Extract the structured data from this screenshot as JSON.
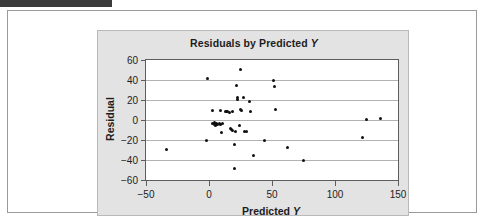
{
  "window": {
    "top_bar_color": "#3b3b3b",
    "page_background": "#ffffff",
    "panel_background": "#e3e3e3"
  },
  "chart_data": {
    "type": "scatter",
    "title": "Residuals by Predicted Y",
    "title_plain": "Residuals by Predicted ",
    "title_italic": "Y",
    "xlabel_plain": "Predicted ",
    "xlabel_italic": "Y",
    "xlabel": "Predicted Y",
    "ylabel": "Residual",
    "xlim": [
      -50,
      150
    ],
    "ylim": [
      -60,
      60
    ],
    "xticks": [
      -50,
      0,
      50,
      100,
      150
    ],
    "yticks": [
      60,
      40,
      20,
      0,
      -20,
      -40,
      -60
    ],
    "xtick_labels": [
      "−50",
      "0",
      "50",
      "100",
      "150"
    ],
    "ytick_labels": [
      "60",
      "40",
      "20",
      "0",
      "−20",
      "−40",
      "−60"
    ],
    "grid": "horizontal",
    "grid_color": "#b2b2b2",
    "legend": "none",
    "marker_color": "#101010",
    "marker_size_px": 3,
    "n_points": 48,
    "points": [
      [
        -34,
        -29
      ],
      [
        -1,
        42
      ],
      [
        -2,
        -20
      ],
      [
        3,
        10
      ],
      [
        3,
        -3
      ],
      [
        4,
        -4
      ],
      [
        4,
        -2
      ],
      [
        5,
        -5
      ],
      [
        5,
        -3
      ],
      [
        6,
        -3
      ],
      [
        7,
        -4
      ],
      [
        8,
        -3
      ],
      [
        9,
        10
      ],
      [
        9,
        -4
      ],
      [
        10,
        -12
      ],
      [
        11,
        -3
      ],
      [
        13,
        9
      ],
      [
        14,
        9
      ],
      [
        15,
        9
      ],
      [
        16,
        8
      ],
      [
        17,
        -8
      ],
      [
        18,
        -9
      ],
      [
        19,
        9
      ],
      [
        19,
        -10
      ],
      [
        20,
        -24
      ],
      [
        20,
        -48
      ],
      [
        21,
        -11
      ],
      [
        22,
        35
      ],
      [
        23,
        23
      ],
      [
        23,
        21
      ],
      [
        24,
        -5
      ],
      [
        25,
        51
      ],
      [
        25,
        11
      ],
      [
        26,
        10
      ],
      [
        27,
        23
      ],
      [
        28,
        -11
      ],
      [
        30,
        -11
      ],
      [
        32,
        19
      ],
      [
        33,
        9
      ],
      [
        35,
        -35
      ],
      [
        44,
        -20
      ],
      [
        51,
        40
      ],
      [
        52,
        34
      ],
      [
        53,
        11
      ],
      [
        62,
        -27
      ],
      [
        75,
        -40
      ],
      [
        122,
        -17
      ],
      [
        125,
        1
      ],
      [
        136,
        2
      ]
    ]
  }
}
